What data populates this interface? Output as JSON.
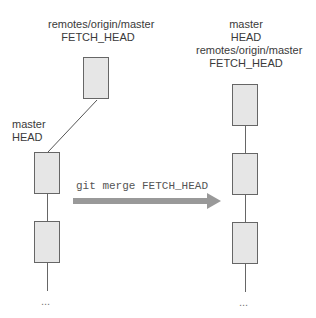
{
  "diagram": {
    "left": {
      "remote_labels": [
        "remotes/origin/master",
        "FETCH_HEAD"
      ],
      "local_labels": [
        "master",
        "HEAD"
      ],
      "ellipsis": "..."
    },
    "right": {
      "labels": [
        "master",
        "HEAD",
        "remotes/origin/master",
        "FETCH_HEAD"
      ],
      "ellipsis": "..."
    },
    "command": "git merge FETCH_HEAD",
    "colors": {
      "box_fill": "#e6e6e6",
      "box_border": "#666666",
      "arrow": "#999999"
    }
  }
}
